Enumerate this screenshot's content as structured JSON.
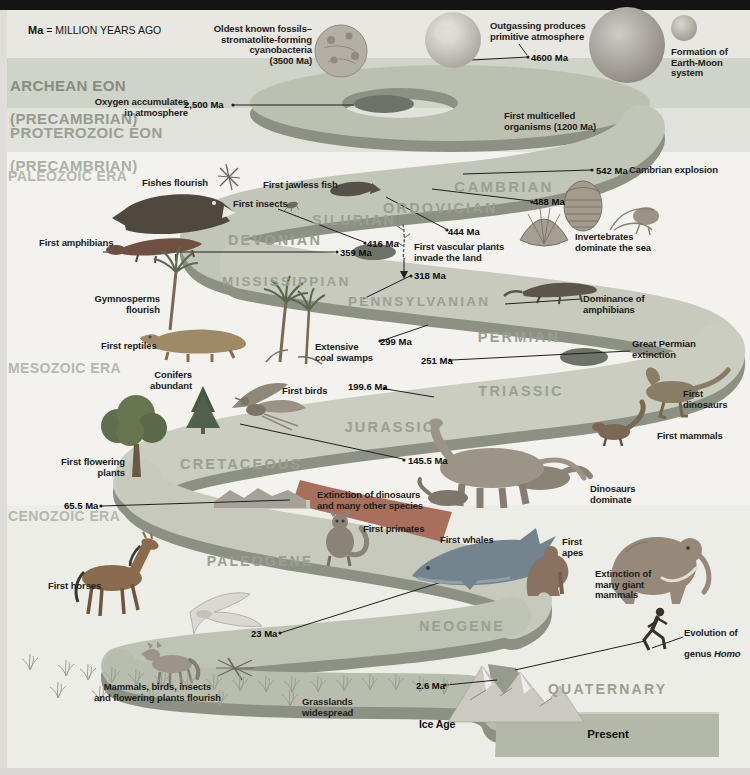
{
  "colors": {
    "topbar": "#141414",
    "background": "#f3f2ef",
    "band_top": "#e8e7e2",
    "band_archean": "#d0d3c8",
    "band_proterozoic": "#e1e2db",
    "band_cenozoic": "#edede7",
    "ribbon_top": "#c4c8ba",
    "ribbon_edge": "#8c9184",
    "era_label": "#868d81",
    "era_label_light": "#b3b9ac",
    "period_label": "#99a093",
    "text": "#1c1c1a",
    "kpg_red": "#a86f5d",
    "present_panel": "#b4b8a9"
  },
  "legend": {
    "prefix": "Ma",
    "text": "= MILLION YEARS AGO"
  },
  "eras": {
    "archean": {
      "name": "ARCHEAN EON",
      "sub": "(PRECAMBRIAN)"
    },
    "proterozoic": {
      "name": "PROTEROZOIC EON",
      "sub": "(PRECAMBRIAN)"
    },
    "paleozoic": "PALEOZOIC ERA",
    "mesozoic": "MESOZOIC ERA",
    "cenozoic": "CENOZOIC ERA"
  },
  "periods": {
    "cambrian": "CAMBRIAN",
    "ordovician": "ORDOVICIAN",
    "silurian": "SILURIAN",
    "devonian": "DEVONIAN",
    "mississippian": "MISSISSIPPIAN",
    "pennsylvanian": "PENNSYLVANIAN",
    "permian": "PERMIAN",
    "triassic": "TRIASSIC",
    "jurassic": "JURASSIC",
    "cretaceous": "CRETACEOUS",
    "paleogene": "PALEOGENE",
    "neogene": "NEOGENE",
    "quaternary": "QUATERNARY"
  },
  "markers": {
    "m4600": "4600 Ma",
    "m2500": "2,500 Ma",
    "m542": "542 Ma",
    "m488": "488 Ma",
    "m444": "444 Ma",
    "m416": "416 Ma",
    "m359": "359 Ma",
    "m318": "318 Ma",
    "m299": "299 Ma",
    "m251": "251 Ma",
    "m199": "199.6 Ma",
    "m145": "145.5 Ma",
    "m65": "65.5 Ma",
    "m23": "23 Ma",
    "m2_6": "2.6 Ma"
  },
  "events": {
    "oldest_fossils": "Oldest known fossils–\nstromatolite-forming\ncyanobacteria\n(3500 Ma)",
    "outgassing": "Outgassing produces\nprimitive atmosphere",
    "formation_moon": "Formation of\nEarth-Moon system",
    "oxygen": "Oxygen accumulates\nin atmosphere",
    "multicelled": "First multicelled\norganisms (1200 Ma)",
    "cambrian_explosion": "Cambrian explosion",
    "fishes": "Fishes flourish",
    "jawless_fish": "First jawless fish",
    "first_insects": "First insects",
    "first_amphibians": "First amphibians",
    "invertebrates": "Invertebrates\ndominate the sea",
    "vascular_plants": "First vascular plants\ninvade the land",
    "gymnosperms": "Gymnosperms\nflourish",
    "first_reptiles": "First reptiles",
    "coal_swamps": "Extensive\ncoal swamps",
    "amphibian_dominance": "Dominance of\namphibians",
    "permian_extinction": "Great Permian\nextinction",
    "conifers": "Conifers\nabundant",
    "first_birds": "First birds",
    "first_dinosaurs": "First dinosaurs",
    "first_mammals": "First mammals",
    "flowering_plants": "First flowering\nplants",
    "dino_extinction": "Extinction of dinosaurs\nand many other species",
    "dino_dominate": "Dinosaurs\ndominate",
    "first_horses": "First horses",
    "first_primates": "First primates",
    "first_whales": "First whales",
    "first_apes": "First\napes",
    "giant_mammals": "Extinction of\nmany giant\nmammals",
    "mammals_flourish": "Mammals, birds, insects\nand flowering plants flourish",
    "grasslands": "Grasslands\nwidespread"
  },
  "labels": {
    "ice_age": "Ice Age",
    "present": "Present"
  },
  "homo": {
    "line1": "Evolution of",
    "line2_prefix": "genus ",
    "line2_italic": "Homo"
  },
  "illustrations": [
    "earth-forming",
    "stromatolite-fossil",
    "large-planet",
    "moon",
    "dunkleosteus-fish",
    "silurian-dragonfly",
    "jawless-fish",
    "first-insect",
    "early-amphibian",
    "trilobite-fossil",
    "brachiopod-fossil",
    "crinoid-fossil",
    "vascular-plant",
    "palm-tree",
    "crocodile-reptile",
    "coal-swamp-palms",
    "permian-amphibian",
    "flowering-tree",
    "conifer-tree",
    "archaeopteryx",
    "theropod-dinosaur",
    "sauropod-dinosaurs",
    "early-mammal",
    "kpg-landscape",
    "lemur-primate",
    "horse",
    "seagull",
    "whale",
    "ape",
    "mammoth",
    "running-human",
    "wolf",
    "dragonfly",
    "grass-tufts",
    "ice-age-mountains",
    "present-panel"
  ]
}
